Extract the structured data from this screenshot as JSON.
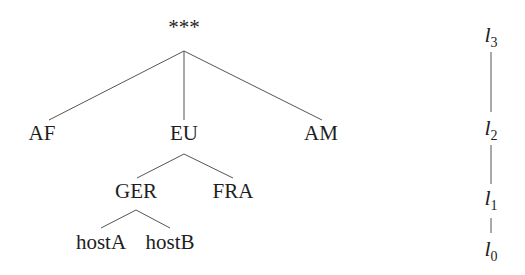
{
  "diagram": {
    "type": "hierarchy-tree",
    "nodes": {
      "root": {
        "label": "***",
        "x": 184,
        "y": 27
      },
      "af": {
        "label": "AF",
        "x": 42,
        "y": 133
      },
      "eu": {
        "label": "EU",
        "x": 184,
        "y": 133
      },
      "am": {
        "label": "AM",
        "x": 321,
        "y": 133
      },
      "ger": {
        "label": "GER",
        "x": 136,
        "y": 191
      },
      "fra": {
        "label": "FRA",
        "x": 233,
        "y": 191
      },
      "hosta": {
        "label": "hostA",
        "x": 101,
        "y": 242
      },
      "hostb": {
        "label": "hostB",
        "x": 170,
        "y": 242
      }
    },
    "edges": [
      {
        "from": "root",
        "to": "af",
        "x1": 184,
        "y1": 51,
        "x2": 49,
        "y2": 120
      },
      {
        "from": "root",
        "to": "eu",
        "x1": 184,
        "y1": 51,
        "x2": 184,
        "y2": 120
      },
      {
        "from": "root",
        "to": "am",
        "x1": 184,
        "y1": 51,
        "x2": 322,
        "y2": 120
      },
      {
        "from": "eu",
        "to": "ger",
        "x1": 184,
        "y1": 154,
        "x2": 137,
        "y2": 178
      },
      {
        "from": "eu",
        "to": "fra",
        "x1": 184,
        "y1": 154,
        "x2": 233,
        "y2": 178
      },
      {
        "from": "ger",
        "to": "hosta",
        "x1": 136,
        "y1": 210,
        "x2": 101,
        "y2": 228
      },
      {
        "from": "ger",
        "to": "hostb",
        "x1": 136,
        "y1": 210,
        "x2": 170,
        "y2": 228
      }
    ],
    "levels": [
      {
        "label": "l",
        "sub": "3",
        "x": 491,
        "y": 36
      },
      {
        "label": "l",
        "sub": "2",
        "x": 491,
        "y": 129
      },
      {
        "label": "l",
        "sub": "1",
        "x": 491,
        "y": 199
      },
      {
        "label": "l",
        "sub": "0",
        "x": 491,
        "y": 250
      }
    ],
    "level_connectors": [
      {
        "x": 491,
        "y1": 52,
        "y2": 112
      },
      {
        "x": 491,
        "y1": 145,
        "y2": 184
      },
      {
        "x": 491,
        "y1": 218,
        "y2": 233
      }
    ]
  }
}
